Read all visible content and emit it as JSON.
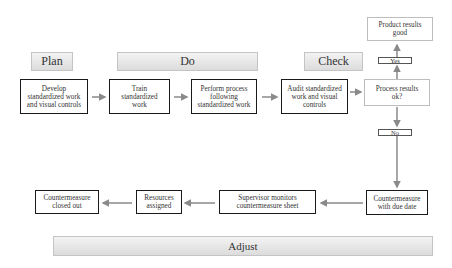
{
  "phases": {
    "plan": "Plan",
    "do": "Do",
    "check": "Check",
    "adjust": "Adjust"
  },
  "top_row": [
    {
      "id": "develop",
      "label": "Develop standardized work and visual controls"
    },
    {
      "id": "train",
      "label": "Train standardized work"
    },
    {
      "id": "perform",
      "label": "Perform process following standardized work"
    },
    {
      "id": "audit",
      "label": "Audit standardized work and visual controls"
    },
    {
      "id": "process-results",
      "label": "Process results ok?"
    }
  ],
  "decision": {
    "yes_label": "Yes",
    "no_label": "No",
    "yes_outcome": "Product results good"
  },
  "bottom_row": [
    {
      "id": "countermeasure-due",
      "label": "Countermeasure with due date"
    },
    {
      "id": "supervisor",
      "label": "Supervisor monitors countermeasure sheet"
    },
    {
      "id": "resources",
      "label": "Resources assigned"
    },
    {
      "id": "closed-out",
      "label": "Countermeasure closed out"
    }
  ],
  "colors": {
    "arrow": "#8a8a8a",
    "box_border": "#1a1a1a",
    "phase_fill_top": "#f3f3f3",
    "phase_fill_bottom": "#dcdcdc"
  }
}
